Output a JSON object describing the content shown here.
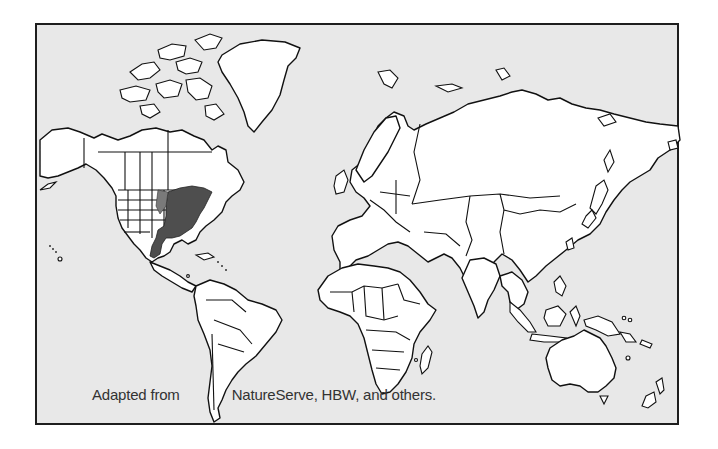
{
  "map": {
    "title": "World range map",
    "projection": "Mercator-style world outline",
    "background_color": "#e8e8e8",
    "land_color": "#ffffff",
    "range_color": "#4e4e4e",
    "highlighted_range": {
      "label": "Eastern & central United States, Texas into northeastern Mexico",
      "region": "North America"
    },
    "caption": {
      "part1": "Adapted from",
      "part2": "NatureServe, HBW, and others."
    }
  }
}
